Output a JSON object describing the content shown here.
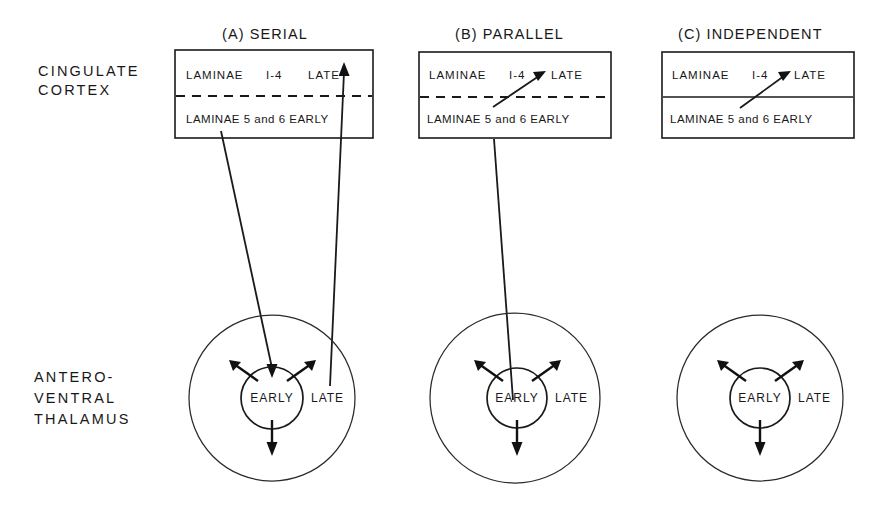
{
  "figure": {
    "caption_title": "Models of cingulate cortex and anteroventral thalamus interaction",
    "background_color": "#ffffff",
    "ink_color": "#1a1a1a"
  },
  "row_labels": [
    {
      "id": "cingulate-cortex",
      "lines": [
        "CINGULATE",
        "CORTEX"
      ]
    },
    {
      "id": "anteroventral-thalamus",
      "lines": [
        "ANTERO-",
        "VENTRAL",
        "THALAMUS"
      ]
    }
  ],
  "panels": [
    {
      "id": "serial",
      "title": "(A) SERIAL",
      "divider_style": "dashed",
      "cortex_box": {
        "upper_row": {
          "laminae": "LAMINAE",
          "range": "I-4",
          "timing": "LATE"
        },
        "lower_row": {
          "text": "LAMINAE 5 and 6 EARLY"
        }
      },
      "thalamus": {
        "outer_label": "LATE",
        "inner_label": "EARLY",
        "radiating_arrows": 3
      },
      "connections": [
        {
          "name": "laminae-5-6-to-thalamus-early",
          "from": "cortex lower row (LAMINAE 5 and 6 EARLY)",
          "to": "thalamic EARLY core",
          "arrowhead": "at thalamus"
        },
        {
          "name": "thalamus-late-to-laminae-1-4",
          "from": "thalamic LATE shell",
          "to": "cortex upper row (LATE)",
          "arrowhead": "at cortex"
        }
      ]
    },
    {
      "id": "parallel",
      "title": "(B) PARALLEL",
      "divider_style": "dashed",
      "cortex_box": {
        "upper_row": {
          "laminae": "LAMINAE",
          "range": "I-4",
          "timing": "LATE"
        },
        "lower_row": {
          "text": "LAMINAE 5 and 6 EARLY"
        }
      },
      "thalamus": {
        "outer_label": "LATE",
        "inner_label": "EARLY",
        "radiating_arrows": 3
      },
      "connections": [
        {
          "name": "thalamus-early-to-cortex",
          "from": "thalamic EARLY core",
          "to": "cortex lower row then diagonally up to LATE",
          "arrowhead": "at cortex LATE"
        }
      ]
    },
    {
      "id": "independent",
      "title": "(C) INDEPENDENT",
      "divider_style": "solid",
      "cortex_box": {
        "upper_row": {
          "laminae": "LAMINAE",
          "range": "I-4",
          "timing": "LATE"
        },
        "lower_row": {
          "text": "LAMINAE 5 and 6 EARLY"
        }
      },
      "thalamus": {
        "outer_label": "LATE",
        "inner_label": "EARLY",
        "radiating_arrows": 3
      },
      "connections": [
        {
          "name": "intracortical-early-to-late",
          "from": "cortex lower row (LAMINAE 5 and 6 EARLY)",
          "to": "cortex upper row (LATE)",
          "arrowhead": "at cortex LATE"
        }
      ]
    }
  ]
}
